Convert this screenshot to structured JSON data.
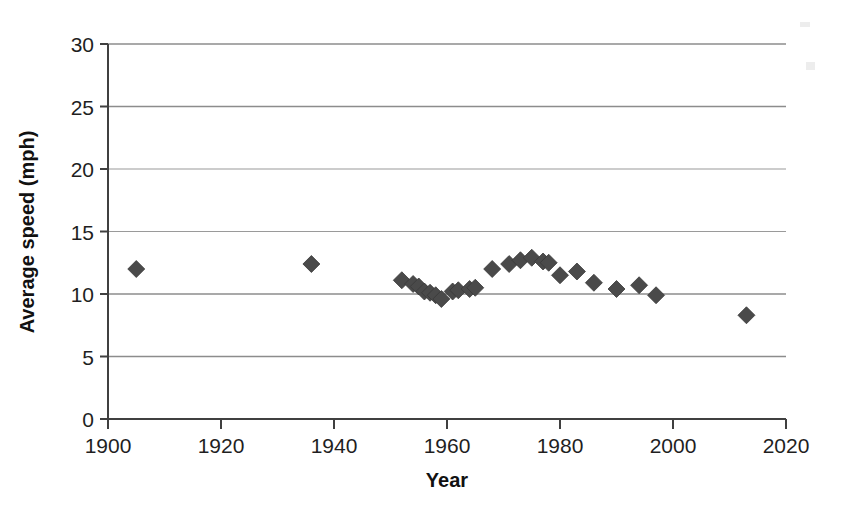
{
  "chart_data": {
    "type": "scatter",
    "title": "",
    "xlabel": "Year",
    "ylabel": "Average speed (mph)",
    "xlim": [
      1900,
      2020
    ],
    "ylim": [
      0,
      30
    ],
    "x_ticks": [
      1900,
      1920,
      1940,
      1960,
      1980,
      2000,
      2020
    ],
    "y_ticks": [
      0,
      5,
      10,
      15,
      20,
      25,
      30
    ],
    "x_tick_labels": [
      "1900",
      "1920",
      "1940",
      "1960",
      "1980",
      "2000",
      "2020"
    ],
    "y_tick_labels": [
      "0",
      "5",
      "10",
      "15",
      "20",
      "25",
      "30"
    ],
    "grid": "horizontal",
    "legend": "none",
    "marker": "diamond",
    "marker_color": "#4a4a4a",
    "series": [
      {
        "name": "Average speed",
        "points": [
          {
            "x": 1905,
            "y": 12.0
          },
          {
            "x": 1936,
            "y": 12.4
          },
          {
            "x": 1952,
            "y": 11.1
          },
          {
            "x": 1954,
            "y": 10.8
          },
          {
            "x": 1955,
            "y": 10.6
          },
          {
            "x": 1956,
            "y": 10.2
          },
          {
            "x": 1957,
            "y": 10.1
          },
          {
            "x": 1958,
            "y": 9.9
          },
          {
            "x": 1959,
            "y": 9.6
          },
          {
            "x": 1961,
            "y": 10.2
          },
          {
            "x": 1962,
            "y": 10.3
          },
          {
            "x": 1964,
            "y": 10.4
          },
          {
            "x": 1965,
            "y": 10.5
          },
          {
            "x": 1968,
            "y": 12.0
          },
          {
            "x": 1971,
            "y": 12.4
          },
          {
            "x": 1973,
            "y": 12.7
          },
          {
            "x": 1975,
            "y": 12.9
          },
          {
            "x": 1977,
            "y": 12.6
          },
          {
            "x": 1978,
            "y": 12.5
          },
          {
            "x": 1980,
            "y": 11.5
          },
          {
            "x": 1983,
            "y": 11.8
          },
          {
            "x": 1986,
            "y": 10.9
          },
          {
            "x": 1990,
            "y": 10.4
          },
          {
            "x": 1994,
            "y": 10.7
          },
          {
            "x": 1997,
            "y": 9.9
          },
          {
            "x": 2013,
            "y": 8.3
          }
        ]
      }
    ]
  },
  "axes": {
    "x_title": "Year",
    "y_title": "Average speed (mph)"
  },
  "colors": {
    "marker": "#4a4a4a",
    "axis": "#404040",
    "gridline": "#8c8c8c",
    "text": "#1f1f1f",
    "background": "#ffffff"
  }
}
